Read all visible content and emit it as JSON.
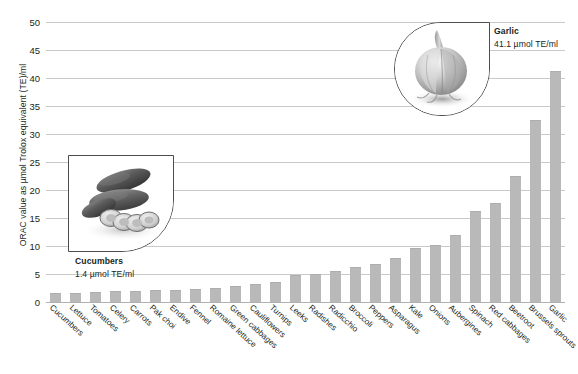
{
  "chart_data": {
    "type": "bar",
    "title": "",
    "xlabel": "",
    "ylabel": "ORAC value as µmol Trolox equivalent (TE)/ml",
    "ylim": [
      0,
      50
    ],
    "yticks": [
      0,
      5,
      10,
      15,
      20,
      25,
      30,
      35,
      40,
      45,
      50
    ],
    "grid": true,
    "legend": "none",
    "bar_color": "#b9b9b9",
    "categories": [
      "Cucumbers",
      "Lettuce",
      "Tomatoes",
      "Celery",
      "Carrots",
      "Pak choi",
      "Endive",
      "Fennel",
      "Romaine lettuce",
      "Green cabbages",
      "Cauliflowers",
      "Turnips",
      "Leeks",
      "Radishes",
      "Radicchio",
      "Broccoli",
      "Peppers",
      "Asparagus",
      "Kale",
      "Onions",
      "Aubergines",
      "Spinach",
      "Red cabbages",
      "Beetroot",
      "Brussels sprouts",
      "Garlic"
    ],
    "values": [
      1.4,
      1.5,
      1.6,
      1.7,
      1.8,
      1.9,
      2.0,
      2.2,
      2.4,
      2.6,
      3.0,
      3.4,
      4.6,
      4.8,
      5.4,
      6.0,
      6.6,
      7.7,
      9.4,
      10.0,
      11.7,
      16.0,
      17.5,
      22.4,
      32.4,
      41.1
    ]
  },
  "axis": {
    "y_title": "ORAC value as µmol Trolox equivalent (TE)/ml",
    "ticks": [
      "0",
      "5",
      "10",
      "15",
      "20",
      "25",
      "30",
      "35",
      "40",
      "45",
      "50"
    ]
  },
  "callouts": {
    "cucumbers": {
      "name": "Cucumbers",
      "value": "1.4 µmol TE/ml",
      "photo": "cucumbers-photo"
    },
    "garlic": {
      "name": "Garlic",
      "value": "41.1 µmol TE/ml",
      "photo": "garlic-photo"
    }
  }
}
